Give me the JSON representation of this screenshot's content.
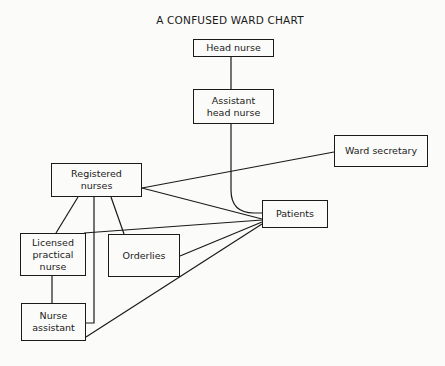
{
  "title": "A CONFUSED WARD CHART",
  "nodes": {
    "head_nurse": {
      "label": "Head nurse"
    },
    "assistant_head_nurse": {
      "label": "Assistant\nhead nurse"
    },
    "ward_secretary": {
      "label": "Ward secretary"
    },
    "registered_nurses": {
      "label": "Registered\nnurses"
    },
    "patients": {
      "label": "Patients"
    },
    "licensed_practical_nurse": {
      "label": "Licensed\npractical\nnurse"
    },
    "orderlies": {
      "label": "Orderlies"
    },
    "nurse_assistant": {
      "label": "Nurse\nassistant"
    }
  },
  "edges": [
    [
      "Head nurse",
      "Assistant head nurse"
    ],
    [
      "Assistant head nurse",
      "Patients"
    ],
    [
      "Registered nurses",
      "Ward secretary"
    ],
    [
      "Registered nurses",
      "Patients"
    ],
    [
      "Registered nurses",
      "Licensed practical nurse"
    ],
    [
      "Registered nurses",
      "Orderlies"
    ],
    [
      "Registered nurses",
      "Nurse assistant"
    ],
    [
      "Licensed practical nurse",
      "Patients"
    ],
    [
      "Licensed practical nurse",
      "Nurse assistant"
    ],
    [
      "Orderlies",
      "Patients"
    ],
    [
      "Nurse assistant",
      "Patients"
    ]
  ]
}
